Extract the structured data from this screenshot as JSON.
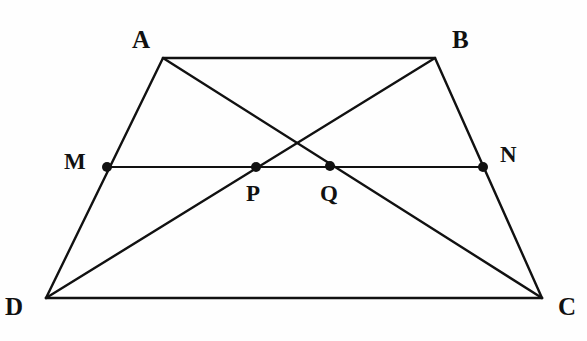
{
  "figure": {
    "background_color": "#fefefe",
    "stroke_color": "#111111",
    "label_color": "#111111",
    "width": 587,
    "height": 341
  },
  "chart_data": {
    "type": "diagram",
    "subtype": "euclidean-geometry",
    "coordinate_space": {
      "width": 587,
      "height": 341,
      "y_axis": "down"
    },
    "points": [
      {
        "id": "A",
        "label": "A",
        "x": 163,
        "y": 58,
        "marker": "none",
        "label_x": 132,
        "label_y": 27
      },
      {
        "id": "B",
        "label": "B",
        "x": 435,
        "y": 58,
        "marker": "none",
        "label_x": 452,
        "label_y": 27
      },
      {
        "id": "C",
        "label": "C",
        "x": 542,
        "y": 298,
        "marker": "none",
        "label_x": 558,
        "label_y": 294
      },
      {
        "id": "D",
        "label": "D",
        "x": 46,
        "y": 298,
        "marker": "none",
        "label_x": 5,
        "label_y": 294
      },
      {
        "id": "M",
        "label": "M",
        "x": 107,
        "y": 167,
        "marker": "dot",
        "label_x": 64,
        "label_y": 150
      },
      {
        "id": "N",
        "label": "N",
        "x": 483,
        "y": 167,
        "marker": "dot",
        "label_x": 500,
        "label_y": 143
      },
      {
        "id": "P",
        "label": "P",
        "x": 256,
        "y": 167,
        "marker": "dot",
        "label_x": 246,
        "label_y": 182
      },
      {
        "id": "Q",
        "label": "Q",
        "x": 330,
        "y": 166,
        "marker": "dot",
        "label_x": 320,
        "label_y": 182
      }
    ],
    "segments": [
      {
        "id": "AB",
        "name": "top-side-ab",
        "from": "A",
        "to": "B",
        "width": 2.4
      },
      {
        "id": "DC",
        "name": "bottom-side-dc",
        "from": "D",
        "to": "C",
        "width": 2.6
      },
      {
        "id": "AD",
        "name": "left-side-ad",
        "from": "A",
        "to": "D",
        "width": 2.4
      },
      {
        "id": "BC",
        "name": "right-side-bc",
        "from": "B",
        "to": "C",
        "width": 2.4
      },
      {
        "id": "AC",
        "name": "diagonal-ac",
        "from": "A",
        "to": "C",
        "width": 2.4
      },
      {
        "id": "BD",
        "name": "diagonal-bd",
        "from": "B",
        "to": "D",
        "width": 2.4
      },
      {
        "id": "MN",
        "name": "midsegment-mn",
        "from": "M",
        "to": "N",
        "width": 2.2
      }
    ],
    "marker_radius": 5
  }
}
